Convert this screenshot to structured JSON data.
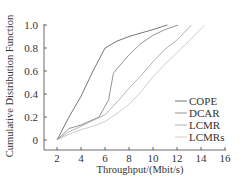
{
  "chart_data": {
    "type": "line",
    "title": "",
    "xlabel": "Throughput/(Mbit/s)",
    "ylabel": "Cumulative Distribution Function",
    "xlim": [
      1,
      16
    ],
    "ylim": [
      -0.05,
      1.0
    ],
    "x_ticks": [
      2,
      4,
      6,
      8,
      10,
      12,
      14,
      16
    ],
    "x_tick_labels": [
      "2",
      "4",
      "6",
      "8",
      "10",
      "12",
      "14",
      "16"
    ],
    "y_ticks": [
      0,
      0.2,
      0.4,
      0.6,
      0.8,
      1.0
    ],
    "y_tick_labels": [
      "0",
      "0.2",
      "0.4",
      "0.6",
      "0.8",
      "1.0"
    ],
    "grid": false,
    "legend_position": "lower right",
    "series": [
      {
        "name": "COPE",
        "color": "#666666",
        "dash": "",
        "points": [
          [
            2,
            0
          ],
          [
            3,
            0.2
          ],
          [
            4,
            0.38
          ],
          [
            5,
            0.6
          ],
          [
            6,
            0.8
          ],
          [
            7,
            0.86
          ],
          [
            8,
            0.9
          ],
          [
            9,
            0.93
          ],
          [
            10,
            0.96
          ],
          [
            11.2,
            1.0
          ]
        ]
      },
      {
        "name": "DCAR",
        "color": "#888888",
        "dash": "",
        "points": [
          [
            2,
            0
          ],
          [
            3,
            0.1
          ],
          [
            4,
            0.13
          ],
          [
            5.5,
            0.2
          ],
          [
            6.3,
            0.35
          ],
          [
            6.7,
            0.58
          ],
          [
            7,
            0.62
          ],
          [
            8,
            0.74
          ],
          [
            9,
            0.84
          ],
          [
            10,
            0.91
          ],
          [
            11,
            0.96
          ],
          [
            12.1,
            1.0
          ]
        ]
      },
      {
        "name": "LCMR",
        "color": "#aaaaaa",
        "dash": "",
        "points": [
          [
            2,
            0
          ],
          [
            3,
            0.07
          ],
          [
            4,
            0.12
          ],
          [
            5,
            0.17
          ],
          [
            6,
            0.22
          ],
          [
            7,
            0.33
          ],
          [
            8,
            0.45
          ],
          [
            9,
            0.56
          ],
          [
            10,
            0.68
          ],
          [
            11,
            0.79
          ],
          [
            12,
            0.87
          ],
          [
            13.2,
            1.0
          ]
        ]
      },
      {
        "name": "LCMRs",
        "color": "#c8c8c8",
        "dash": "",
        "points": [
          [
            2,
            0
          ],
          [
            3,
            0.05
          ],
          [
            4,
            0.09
          ],
          [
            5,
            0.12
          ],
          [
            6,
            0.16
          ],
          [
            7,
            0.23
          ],
          [
            8,
            0.31
          ],
          [
            9,
            0.42
          ],
          [
            10,
            0.55
          ],
          [
            11,
            0.66
          ],
          [
            12,
            0.76
          ],
          [
            13,
            0.86
          ],
          [
            14.3,
            1.0
          ]
        ]
      }
    ]
  },
  "legend": {
    "items": [
      {
        "label": "COPE"
      },
      {
        "label": "DCAR"
      },
      {
        "label": "LCMR"
      },
      {
        "label": "LCMRs"
      }
    ]
  }
}
